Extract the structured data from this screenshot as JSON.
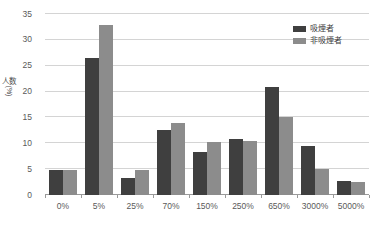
{
  "chart_data": {
    "type": "bar",
    "title": "",
    "xlabel": "",
    "ylabel": "人数 (%)",
    "ylabel_main": "人数",
    "ylabel_unit": "(%)",
    "categories": [
      "0%",
      "5%",
      "25%",
      "70%",
      "150%",
      "250%",
      "650%",
      "3000%",
      "5000%"
    ],
    "series": [
      {
        "name": "吸煙者",
        "color": "#3f3f3f",
        "values": [
          4.8,
          26.5,
          3.3,
          12.5,
          8.3,
          10.8,
          20.8,
          9.5,
          2.8
        ]
      },
      {
        "name": "非吸煙者",
        "color": "#8c8c8c",
        "values": [
          4.9,
          32.8,
          4.8,
          14.0,
          10.3,
          10.5,
          15.0,
          5.0,
          2.5
        ]
      }
    ],
    "ylim": [
      0,
      35
    ],
    "yticks": [
      0,
      5,
      10,
      15,
      20,
      25,
      30,
      35
    ],
    "ytick_labels": [
      "0",
      "5",
      "10",
      "15",
      "20",
      "25",
      "30",
      "35"
    ],
    "grid": true,
    "legend_position": "top-right"
  },
  "legend": {
    "items": [
      {
        "label": "吸煙者",
        "color": "#3f3f3f"
      },
      {
        "label": "非吸煙者",
        "color": "#8c8c8c"
      }
    ]
  },
  "colors": {
    "series_dark": "#3f3f3f",
    "series_light": "#8c8c8c",
    "gridline": "#d4d4d4",
    "axis": "#9a9a9a",
    "text": "#5a5a5a",
    "background": "#ffffff"
  }
}
